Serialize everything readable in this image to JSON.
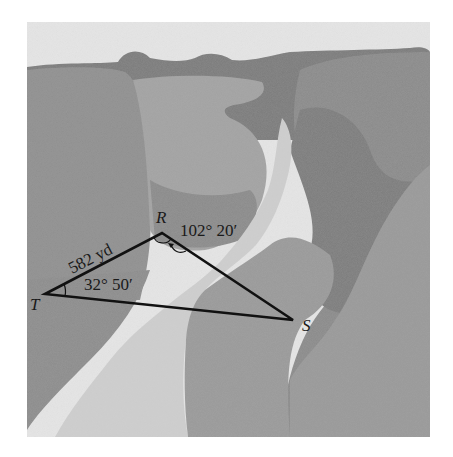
{
  "figure": {
    "colors": {
      "sky": "#e6e6e6",
      "far_ridge": "#7a7a7a",
      "left_cliff": "#8f8f8f",
      "center_mesa": "#a3a3a3",
      "river": "#cfcfcf",
      "right_cliff": "#8a8a8a",
      "right_dark": "#7c7c7c",
      "foreground_mid": "#9a9a9a",
      "line": "#111111"
    },
    "triangle": {
      "vertices": {
        "T": {
          "label": "T",
          "x": 45,
          "y": 294
        },
        "R": {
          "label": "R",
          "x": 162,
          "y": 233
        },
        "S": {
          "label": "S",
          "x": 293,
          "y": 320
        }
      },
      "side_TR": {
        "label": "582 yd"
      },
      "angle_T": {
        "label": "32° 50′"
      },
      "angle_R": {
        "label": "102° 20′"
      }
    }
  }
}
